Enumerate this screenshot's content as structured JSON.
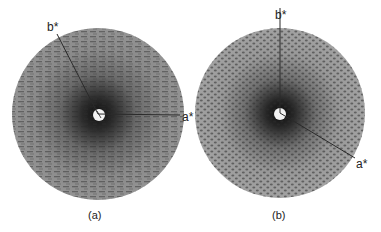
{
  "figure": {
    "panels": [
      {
        "id": "a",
        "caption": "(a)",
        "center": [
          98,
          114
        ],
        "radius": 86,
        "base_color": "#8d8d8d",
        "core_color": "#1e1e1e",
        "axes": [
          {
            "label": "b*",
            "from": [
              98,
              114
            ],
            "to": [
              57,
              34
            ],
            "label_pos": [
              50,
              31
            ]
          },
          {
            "label": "a*",
            "from": [
              98,
              114
            ],
            "to": [
              180,
              115
            ],
            "label_pos": [
              182,
              121
            ]
          }
        ],
        "pattern": "streaky"
      },
      {
        "id": "b",
        "caption": "(b)",
        "center": [
          280,
          113
        ],
        "radius": 85,
        "base_color": "#9b9b9b",
        "core_color": "#1a1a1a",
        "axes": [
          {
            "label": "b*",
            "from": [
              280,
              113
            ],
            "to": [
              280,
              8
            ],
            "label_pos": [
              276,
              19
            ]
          },
          {
            "label": "a*",
            "from": [
              280,
              113
            ],
            "to": [
              355,
              158
            ],
            "label_pos": [
              358,
              167
            ]
          }
        ],
        "pattern": "hexagonal"
      }
    ]
  }
}
